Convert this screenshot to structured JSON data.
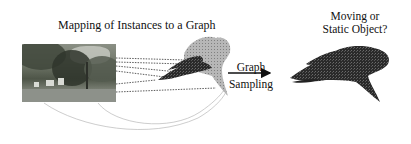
{
  "figure": {
    "left_title": "Mapping of Instances to a Graph",
    "arrow_label_line1": "Graph",
    "arrow_label_line2": "Sampling",
    "right_title_line1": "Moving or",
    "right_title_line2": "Static Object?"
  },
  "elements": {
    "input_image": "street-scene-photo",
    "instance_graph": "gray-point-cloud-graph-with-dark-highlighted-subgraph",
    "sampled_graph": "dark-point-cloud-subgraph",
    "mapping_lines": "dotted-lines-from-image-to-graph",
    "mapping_curves": "thin-gray-curves-from-image-to-graph"
  },
  "colors": {
    "graph_gray": "#9a9a9a",
    "graph_dark": "#1a1a1a",
    "text": "#111111",
    "background": "#ffffff"
  }
}
